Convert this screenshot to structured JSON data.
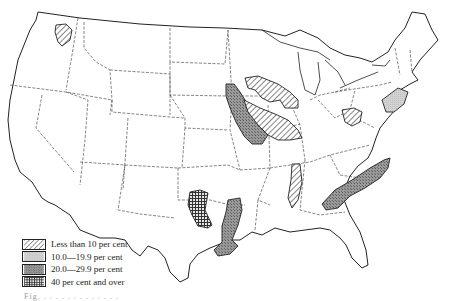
{
  "map": {
    "type": "choropleth",
    "region": "United States (contiguous)",
    "pattern_colors": {
      "hatch": "#333333",
      "light": "#cfcfcf",
      "medium": "#8f8f8f",
      "dense": "#3a3a3a",
      "outline": "#222222"
    },
    "legend": {
      "items": [
        {
          "label": "Less than 10 per cent",
          "pattern": "diagonal-hatch"
        },
        {
          "label": "10.0—19.9 per cent",
          "pattern": "light-stipple"
        },
        {
          "label": "20.0—29.9 per cent",
          "pattern": "medium-stipple"
        },
        {
          "label": "40 per cent and over",
          "pattern": "crosshatch-grid"
        }
      ]
    },
    "shaded_areas": [
      {
        "location": "Northeastern Washington",
        "class": "Less than 10 per cent"
      },
      {
        "location": "Southern Minnesota / Northern Iowa",
        "class": "Less than 10 per cent"
      },
      {
        "location": "Eastern Nebraska / Kansas / Iowa",
        "class": "20.0—29.9 per cent"
      },
      {
        "location": "Western Iowa / Missouri",
        "class": "Less than 10 per cent"
      },
      {
        "location": "Indiana / Ohio",
        "class": "Less than 10 per cent"
      },
      {
        "location": "Pennsylvania",
        "class": "10.0—19.9 per cent"
      },
      {
        "location": "Mississippi Delta",
        "class": "Less than 10 per cent"
      },
      {
        "location": "Georgia / South Carolina / North Carolina Piedmont",
        "class": "20.0—29.9 per cent"
      },
      {
        "location": "Western Oklahoma",
        "class": "40 per cent and over"
      },
      {
        "location": "Central Texas",
        "class": "20.0—29.9 per cent"
      }
    ]
  },
  "caption": "Fig. . . . . . . . . . . . . ."
}
